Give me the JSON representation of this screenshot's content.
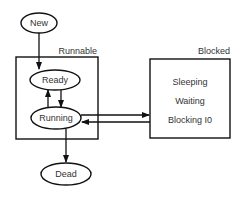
{
  "diagram": {
    "type": "state-diagram",
    "states": [
      {
        "id": "new",
        "label": "New"
      },
      {
        "id": "ready",
        "label": "Ready",
        "group": "runnable"
      },
      {
        "id": "running",
        "label": "Running",
        "group": "runnable"
      },
      {
        "id": "dead",
        "label": "Dead"
      }
    ],
    "groups": [
      {
        "id": "runnable",
        "label": "Runnable"
      },
      {
        "id": "blocked",
        "label": "Blocked",
        "items": [
          "Sleeping",
          "Waiting",
          "Blocking I0"
        ]
      }
    ],
    "transitions": [
      {
        "from": "new",
        "to": "ready"
      },
      {
        "from": "ready",
        "to": "running"
      },
      {
        "from": "running",
        "to": "ready"
      },
      {
        "from": "running",
        "to": "blocked"
      },
      {
        "from": "blocked",
        "to": "running"
      },
      {
        "from": "running",
        "to": "dead"
      }
    ],
    "colors": {
      "stroke": "#111111",
      "text": "#333333",
      "background": "#ffffff"
    }
  }
}
